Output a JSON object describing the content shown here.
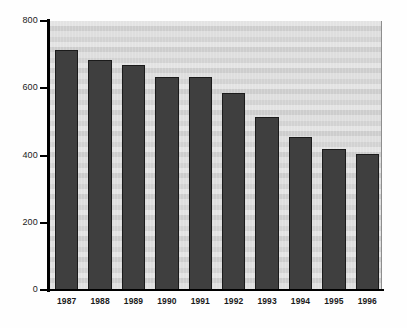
{
  "chart_data": {
    "type": "bar",
    "title": "",
    "subtitle": "",
    "xlabel": "",
    "ylabel": "",
    "categories": [
      "1987",
      "1988",
      "1989",
      "1990",
      "1991",
      "1992",
      "1993",
      "1994",
      "1995",
      "1996"
    ],
    "values": [
      715,
      685,
      670,
      635,
      635,
      585,
      515,
      455,
      420,
      405
    ],
    "series": [
      {
        "name": "",
        "values": [
          715,
          685,
          670,
          635,
          635,
          585,
          515,
          455,
          420,
          405
        ]
      }
    ],
    "ylim": [
      0,
      800
    ],
    "yticks": [
      0,
      200,
      400,
      600,
      800
    ],
    "ytick_labels": [
      "0",
      "200",
      "400",
      "600",
      "800"
    ],
    "xtick_labels": [
      "1987",
      "1988",
      "1989",
      "1990",
      "1991",
      "1992",
      "1993",
      "1994",
      "1995",
      "1996"
    ],
    "grid": false,
    "legend": null,
    "legend_position": "none",
    "annotations": [],
    "bar_color": "#3f3f3f",
    "bar_edge_color": "#1b1b1b",
    "plot_background_color": "#d9d9d9",
    "axis_color": "#000000",
    "figure_background_color": "#ffffff"
  },
  "axis": {
    "y_tick_labels": [
      "800",
      "600",
      "400",
      "200",
      "0"
    ],
    "x_tick_labels": [
      "1987",
      "1988",
      "1989",
      "1990",
      "1991",
      "1992",
      "1993",
      "1994",
      "1995",
      "1996"
    ]
  }
}
